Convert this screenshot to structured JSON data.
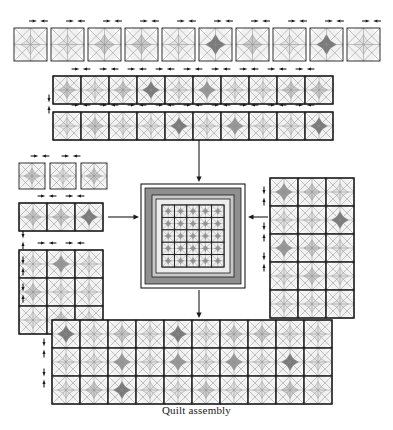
{
  "figure": {
    "caption": "Quilt assembly",
    "type": "quilt-assembly-diagram",
    "title": "Quilt assembly"
  },
  "palette": {
    "background": "#ffffff",
    "outline": "#1a1a1a",
    "thin_line": "#8c8c8c",
    "shade_light": "#e2e2e2",
    "shade_mid": "#c9c9c9",
    "shade_dark": "#9a9a9a",
    "shade_darkest": "#7a7a7a",
    "border_dark": "#8f8f8f",
    "border_mid": "#b8b8b8",
    "border_light": "#ededed",
    "arrow": "#1a1a1a"
  },
  "units": {
    "block_description": "Square block with both diagonals drawn and a shaded four-point star / diamond in the centre",
    "shade_levels": [
      "light",
      "mid",
      "dark",
      "darkest"
    ]
  },
  "sections": [
    {
      "id": "top-loose-blocks",
      "name": "top-row-loose-blocks",
      "label": "Top row of ten individual blocks",
      "layout": "loose",
      "count": 10,
      "cols": 10,
      "rows": 1,
      "x": 14,
      "y": 28,
      "cell": 33,
      "gap": 4,
      "shades": [
        "light",
        "light",
        "mid",
        "mid",
        "light",
        "darkest",
        "mid",
        "light",
        "darkest",
        "light"
      ],
      "arrows_above": true,
      "arrow_count": 10
    },
    {
      "id": "strip-row-1",
      "name": "assembled-strip-row-1",
      "label": "Assembled sashing strip, ten blocks wide",
      "layout": "joined",
      "cols": 10,
      "rows": 1,
      "x": 53,
      "y": 76,
      "cell": 28,
      "shades": [
        "mid",
        "light",
        "mid",
        "darkest",
        "light",
        "dark",
        "light",
        "light",
        "mid",
        "mid"
      ],
      "arrows_above": true,
      "arrow_count": 9
    },
    {
      "id": "strip-row-2",
      "name": "assembled-strip-row-2",
      "label": "Second assembled sashing strip, ten blocks wide",
      "layout": "joined",
      "cols": 10,
      "rows": 1,
      "x": 53,
      "y": 112,
      "cell": 28,
      "shades": [
        "light",
        "mid",
        "light",
        "light",
        "darkest",
        "light",
        "dark",
        "light",
        "light",
        "darkest"
      ],
      "arrows_above": true,
      "arrow_count": 9
    },
    {
      "id": "left-loose-blocks",
      "name": "left-loose-blocks",
      "label": "Three individual blocks at upper left",
      "layout": "loose",
      "count": 3,
      "cols": 3,
      "rows": 1,
      "x": 19,
      "y": 163,
      "cell": 26,
      "gap": 5,
      "shades": [
        "mid",
        "light",
        "mid"
      ],
      "arrows_above": true,
      "arrow_count": 2
    },
    {
      "id": "left-strip",
      "name": "left-assembled-strip",
      "label": "Assembled strip of three blocks, left side",
      "layout": "joined",
      "cols": 3,
      "rows": 1,
      "x": 19,
      "y": 203,
      "cell": 28,
      "shades": [
        "mid",
        "mid",
        "darkest"
      ],
      "arrows_above": true,
      "arrow_count": 2
    },
    {
      "id": "left-panel",
      "name": "left-assembled-panel",
      "label": "Assembled left border panel, three by three blocks",
      "layout": "joined",
      "cols": 3,
      "rows": 3,
      "x": 19,
      "y": 250,
      "cell": 28,
      "shades": [
        "light",
        "dark",
        "light",
        "mid",
        "light",
        "light",
        "light",
        "mid",
        "light"
      ],
      "arrows_above": true,
      "arrow_count": 2
    },
    {
      "id": "right-panel",
      "name": "right-assembled-panel",
      "label": "Assembled right border panel, three blocks wide by five tall",
      "layout": "joined",
      "cols": 3,
      "rows": 5,
      "x": 270,
      "y": 178,
      "cell": 28,
      "shades": [
        "dark",
        "mid",
        "light",
        "light",
        "light",
        "darkest",
        "dark",
        "mid",
        "light",
        "light",
        "mid",
        "light",
        "light",
        "light",
        "light"
      ],
      "arrows_above": false,
      "arrow_count": 0
    },
    {
      "id": "bottom-panel",
      "name": "bottom-assembled-panel",
      "label": "Assembled bottom border panel, ten blocks wide by three tall",
      "layout": "joined",
      "cols": 10,
      "rows": 3,
      "x": 52,
      "y": 320,
      "cell": 28,
      "shades": [
        "darkest",
        "light",
        "mid",
        "light",
        "darkest",
        "light",
        "mid",
        "mid",
        "light",
        "light",
        "light",
        "light",
        "dark",
        "light",
        "dark",
        "light",
        "dark",
        "light",
        "darkest",
        "light",
        "light",
        "mid",
        "darkest",
        "light",
        "light",
        "mid",
        "light",
        "light",
        "mid",
        "light"
      ],
      "arrows_above": false,
      "arrow_count": 0
    }
  ],
  "center_medallion": {
    "name": "center-medallion",
    "label": "Centre medallion with pieced border frames",
    "x": 141,
    "y": 184,
    "size": 104,
    "frames": [
      {
        "name": "outer-white-frame",
        "color": "#ffffff",
        "width": 4
      },
      {
        "name": "dark-outer-border",
        "color": "#8f8f8f",
        "width": 7
      },
      {
        "name": "mid-border",
        "color": "#c9c9c9",
        "width": 4
      },
      {
        "name": "light-inner-border",
        "color": "#ededed",
        "width": 6
      }
    ],
    "grid": {
      "cols": 5,
      "rows": 5,
      "label": "Five by five pieced centre blocks"
    }
  },
  "connectors": [
    {
      "id": "conn-top",
      "name": "connector-arrow-top",
      "direction": "down",
      "x": 199,
      "y1": 140,
      "y2": 182,
      "label": "Join top strip to centre"
    },
    {
      "id": "conn-left",
      "name": "connector-arrow-left",
      "direction": "right",
      "y": 217,
      "x1": 108,
      "x2": 139,
      "label": "Join left panel to centre"
    },
    {
      "id": "conn-right",
      "name": "connector-arrow-right",
      "direction": "left",
      "y": 217,
      "x1": 268,
      "x2": 248,
      "label": "Join right panel to centre"
    },
    {
      "id": "conn-bottom",
      "name": "connector-arrow-bottom",
      "direction": "down",
      "x": 199,
      "y1": 290,
      "y2": 318,
      "label": "Join bottom panel to centre"
    }
  ],
  "seam_arrows_vertical": [
    {
      "id": "sv-1",
      "name": "seam-arrow-pair-strip-rows",
      "x": 49,
      "y": 104,
      "label": "Press seams toward each other"
    },
    {
      "id": "sv-2",
      "name": "seam-arrow-pair-left-upper",
      "x": 23,
      "y": 240,
      "label": "Press seams toward each other"
    },
    {
      "id": "sv-3",
      "name": "seam-arrow-pair-left-lower-a",
      "x": 23,
      "y": 266,
      "label": "Press seams toward each other"
    },
    {
      "id": "sv-4",
      "name": "seam-arrow-pair-left-lower-b",
      "x": 23,
      "y": 293,
      "label": "Press seams toward each other"
    },
    {
      "id": "sv-5",
      "name": "seam-arrow-pair-right-a",
      "x": 264,
      "y": 196,
      "label": "Press seams toward each other"
    },
    {
      "id": "sv-6",
      "name": "seam-arrow-pair-right-b",
      "x": 264,
      "y": 232,
      "label": "Press seams toward each other"
    },
    {
      "id": "sv-7",
      "name": "seam-arrow-pair-right-c",
      "x": 264,
      "y": 262,
      "label": "Press seams toward each other"
    },
    {
      "id": "sv-8",
      "name": "seam-arrow-pair-bottom-a",
      "x": 44,
      "y": 348,
      "label": "Press seams toward each other"
    },
    {
      "id": "sv-9",
      "name": "seam-arrow-pair-bottom-b",
      "x": 44,
      "y": 378,
      "label": "Press seams toward each other"
    }
  ]
}
